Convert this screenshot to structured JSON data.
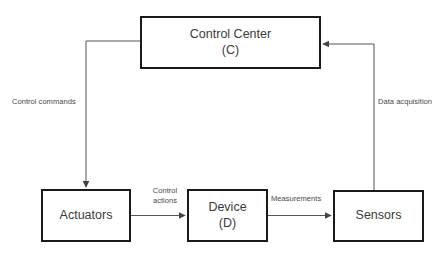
{
  "diagram": {
    "type": "control-loop-block-diagram",
    "canvas": {
      "width": 446,
      "height": 257,
      "background": "#ffffff"
    },
    "colors": {
      "box_border": "#1a1a1a",
      "box_fill": "#ffffff",
      "node_text": "#3b3b3b",
      "edge_line": "#555555",
      "edge_label_text": "#4a4a4a"
    },
    "nodes": [
      {
        "id": "control-center",
        "title": "Control Center",
        "subtitle": "(C)",
        "x": 140,
        "y": 16,
        "width": 181,
        "height": 53
      },
      {
        "id": "actuators",
        "title": "Actuators",
        "subtitle": "",
        "x": 41,
        "y": 189,
        "width": 90,
        "height": 53
      },
      {
        "id": "device",
        "title": "Device",
        "subtitle": "(D)",
        "x": 187,
        "y": 189,
        "width": 81,
        "height": 53
      },
      {
        "id": "sensors",
        "title": "Sensors",
        "subtitle": "",
        "x": 333,
        "y": 190,
        "width": 91,
        "height": 52
      }
    ],
    "edges": [
      {
        "id": "control-commands",
        "label": "Control commands",
        "from": "control-center",
        "to": "actuators",
        "routing": "left-elbow",
        "arrowhead_at": "actuators-top"
      },
      {
        "id": "control-actions",
        "label_line1": "Control",
        "label_line2": "actions",
        "from": "actuators",
        "to": "device",
        "routing": "straight-horizontal",
        "arrowhead_at": "device-left"
      },
      {
        "id": "measurements",
        "label": "Measurements",
        "from": "device",
        "to": "sensors",
        "routing": "straight-horizontal",
        "arrowhead_at": "sensors-left"
      },
      {
        "id": "data-acquisition",
        "label": "Data acquisition",
        "from": "sensors",
        "to": "control-center",
        "routing": "right-elbow",
        "arrowhead_at": "control-center-right"
      }
    ]
  }
}
